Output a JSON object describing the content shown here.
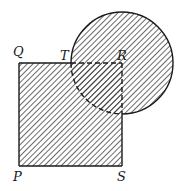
{
  "diagram": {
    "square": {
      "vertices": [
        "P",
        "Q",
        "R",
        "S"
      ],
      "x": 19,
      "y": 63,
      "size": 103
    },
    "circle": {
      "center_label": "R",
      "cx": 122,
      "cy": 63,
      "r": 51
    },
    "point_on_edge": {
      "label": "T",
      "on_segment": "QR"
    },
    "labels": {
      "Q": "Q",
      "T": "T",
      "R": "R",
      "P": "P",
      "S": "S"
    },
    "colors": {
      "stroke": "#1a1a1a",
      "hatch": "#2a2a2a",
      "background": "#ffffff"
    },
    "shading": "diagonal hatching"
  }
}
